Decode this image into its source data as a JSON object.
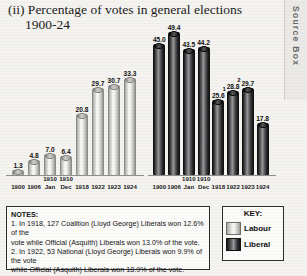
{
  "title": {
    "line1": "(ii) Percentage of votes in general elections",
    "line2": "1900-24"
  },
  "source_tab": {
    "label": "Source Box"
  },
  "chart_data": [
    {
      "type": "bar",
      "name": "Labour",
      "title": "Percentage of votes in general elections 1900-24",
      "categories": [
        "1900",
        "1906",
        "1910 Jan",
        "1910 Dec",
        "1918",
        "1922",
        "1923",
        "1924"
      ],
      "tick_labels": [
        {
          "year": "1900",
          "sub": ""
        },
        {
          "year": "1906",
          "sub": ""
        },
        {
          "year": "1910",
          "sub": "Jan"
        },
        {
          "year": "1910",
          "sub": "Dec"
        },
        {
          "year": "1918",
          "sub": ""
        },
        {
          "year": "1922",
          "sub": ""
        },
        {
          "year": "1923",
          "sub": ""
        },
        {
          "year": "1924",
          "sub": ""
        }
      ],
      "values": [
        1.3,
        4.8,
        7.0,
        6.4,
        20.8,
        29.7,
        30.7,
        33.3
      ],
      "value_labels": [
        "1.3",
        "4.8",
        "7.0",
        "6.4",
        "20.8",
        "29.7",
        "30.7",
        "33.3"
      ],
      "footnotes": [
        "",
        "",
        "",
        "",
        "",
        "",
        "",
        ""
      ],
      "ylim": [
        0,
        52
      ],
      "xlabel": "",
      "ylabel": "",
      "grid": false,
      "legend": "bottom-right",
      "series_color": "#efefec"
    },
    {
      "type": "bar",
      "name": "Liberal",
      "title": "Percentage of votes in general elections 1900-24",
      "categories": [
        "1900",
        "1906",
        "1910 Jan",
        "1910 Dec",
        "1918",
        "1922",
        "1923",
        "1924"
      ],
      "tick_labels": [
        {
          "year": "1900",
          "sub": ""
        },
        {
          "year": "1906",
          "sub": ""
        },
        {
          "year": "1910",
          "sub": "Jan"
        },
        {
          "year": "1910",
          "sub": "Dec"
        },
        {
          "year": "1918",
          "sub": ""
        },
        {
          "year": "1922",
          "sub": ""
        },
        {
          "year": "1923",
          "sub": ""
        },
        {
          "year": "1924",
          "sub": ""
        }
      ],
      "values": [
        45.0,
        49.4,
        43.5,
        44.2,
        25.6,
        28.8,
        29.7,
        17.8
      ],
      "value_labels": [
        "45.0",
        "49.4",
        "43.5",
        "44.2",
        "25.6",
        "28.8",
        "29.7",
        "17.8"
      ],
      "footnotes": [
        "",
        "",
        "",
        "",
        "1",
        "2",
        "",
        ""
      ],
      "ylim": [
        0,
        52
      ],
      "xlabel": "",
      "ylabel": "",
      "grid": false,
      "legend": "bottom-right",
      "series_color": "#2a2a2c"
    }
  ],
  "notes": {
    "heading": "NOTES:",
    "line1": "1. In 1918, 127 Coalition (Lloyd George) Liberals won 12.6% of the",
    "line2": "vote while Official (Asquith) Liberals won 13.0% of the vote.",
    "line3": "2. In 1922, 53 National (Lloyd George) Liberals won 9.9% of the vote",
    "line4": "while Official (Asquith) Liberals won 18.9% of the vote."
  },
  "key": {
    "heading": "KEY:",
    "items": [
      {
        "label": "Labour",
        "color": "#efefec"
      },
      {
        "label": "Liberal",
        "color": "#2a2a2c"
      }
    ]
  }
}
